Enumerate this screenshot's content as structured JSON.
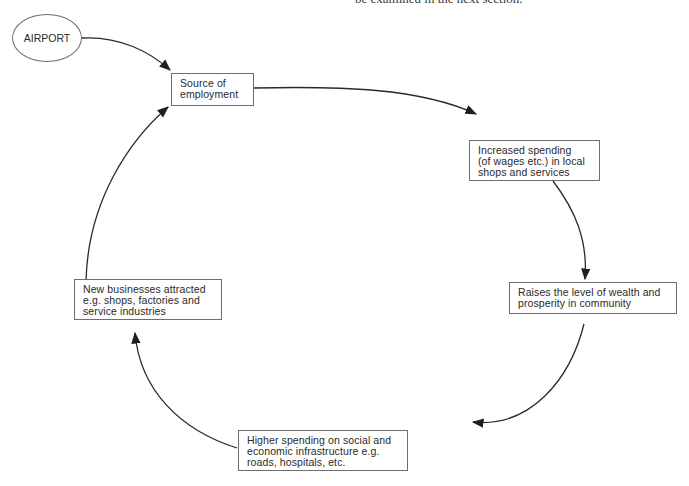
{
  "header": {
    "cut_text": "be examined in the next section."
  },
  "diagram": {
    "start": {
      "label": "AIRPORT"
    },
    "nodes": [
      {
        "id": "source",
        "lines": [
          "Source of",
          "employment"
        ]
      },
      {
        "id": "spending",
        "lines": [
          "Increased spending",
          "(of wages etc.) in local",
          "shops and services"
        ]
      },
      {
        "id": "wealth",
        "lines": [
          "Raises the level of wealth and",
          "prosperity in community"
        ]
      },
      {
        "id": "infrastructure",
        "lines": [
          "Higher spending on social and",
          "economic infrastructure e.g.",
          "roads, hospitals, etc."
        ]
      },
      {
        "id": "businesses",
        "lines": [
          "New businesses attracted",
          "e.g. shops, factories and",
          "service industries"
        ]
      }
    ],
    "edges": [
      {
        "from": "AIRPORT",
        "to": "source"
      },
      {
        "from": "source",
        "to": "spending"
      },
      {
        "from": "spending",
        "to": "wealth"
      },
      {
        "from": "wealth",
        "to": "infrastructure"
      },
      {
        "from": "infrastructure",
        "to": "businesses"
      },
      {
        "from": "businesses",
        "to": "source"
      }
    ],
    "colors": {
      "line": "#2a2a2a",
      "border": "#6e6e6e",
      "background": "#ffffff"
    }
  }
}
